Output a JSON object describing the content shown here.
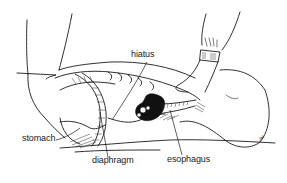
{
  "figure": {
    "labels": {
      "hiatus": "hiatus",
      "stomach": "stomach",
      "diaphragm": "diaphragm",
      "esophagus": "esophagus"
    },
    "signature": "JH",
    "colors": {
      "ink": "#1a1a1a",
      "background": "#ffffff"
    }
  }
}
